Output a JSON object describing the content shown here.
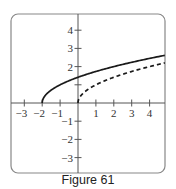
{
  "caption": "Figure 61",
  "chart_data": {
    "type": "line",
    "title": "",
    "xlabel": "",
    "ylabel": "",
    "xlim": [
      -3.8,
      4.85
    ],
    "ylim": [
      -3.9,
      4.9
    ],
    "grid": false,
    "x_ticks": [
      -3,
      -2,
      -1,
      1,
      2,
      3,
      4
    ],
    "x_tick_labels": [
      "−3",
      "−2",
      "−1",
      "1",
      "2",
      "3",
      "4"
    ],
    "y_ticks": [
      4,
      3,
      2,
      1,
      -1,
      -2,
      -3
    ],
    "y_tick_labels": [
      "4",
      "3",
      "2",
      "",
      "−1",
      "−2",
      "−3"
    ],
    "series": [
      {
        "name": "y = sqrt(x + 2)",
        "style": "solid",
        "x": [
          -2,
          -1.75,
          -1.5,
          -1,
          -0.5,
          0,
          1,
          2,
          3,
          4,
          4.85
        ],
        "y": [
          0,
          0.5,
          0.71,
          1.0,
          1.22,
          1.41,
          1.73,
          2.0,
          2.24,
          2.45,
          2.62
        ]
      },
      {
        "name": "y = sqrt(x)",
        "style": "dashed",
        "x": [
          0,
          0.25,
          0.5,
          1,
          2,
          3,
          4,
          4.85
        ],
        "y": [
          0,
          0.5,
          0.71,
          1.0,
          1.41,
          1.73,
          2.0,
          2.2
        ]
      }
    ],
    "colors": {
      "curve": "#1a1a1a",
      "axis": "#555555",
      "frame": "#888888"
    }
  }
}
